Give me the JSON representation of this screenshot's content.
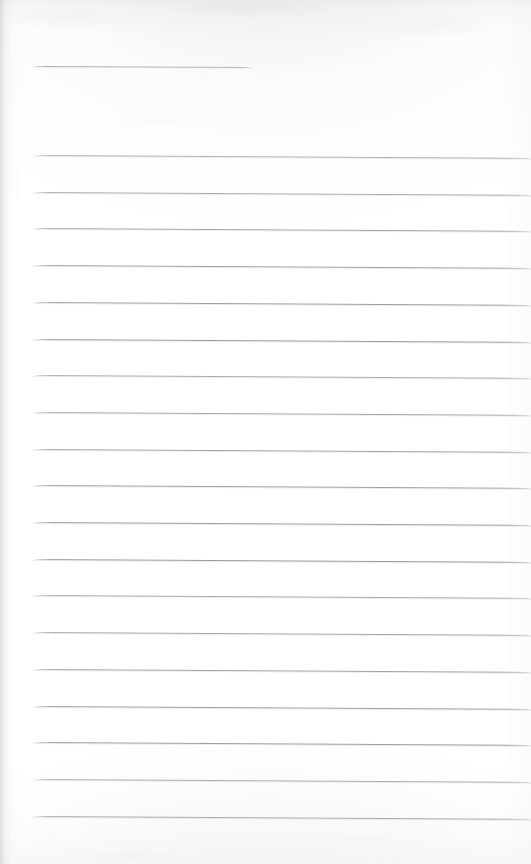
{
  "document": {
    "kind": "scanned-lined-paper",
    "title_text": "",
    "body_text": "",
    "page_width": 531,
    "page_height": 864,
    "paper_color": "#fefefe",
    "rule_color": "#96969d",
    "header_rule_color": "#a4a4ab",
    "shadow_color": "#c4c4c8"
  },
  "header_rule": {
    "name": "title-underline",
    "x_start": 33,
    "x_end": 253,
    "y": 66,
    "slant_px": 1,
    "thickness": 1
  },
  "rules": {
    "count": 19,
    "x_start": 33,
    "x_end": 531,
    "first_y": 155,
    "spacing": 36.7,
    "slant_px": 3,
    "thickness": 1,
    "y_positions": [
      155,
      191.7,
      228.4,
      265.1,
      301.8,
      338.5,
      375.2,
      411.9,
      448.6,
      485.3,
      522,
      558.7,
      595.4,
      632.1,
      668.8,
      705.5,
      742.2,
      778.9,
      815.6
    ]
  }
}
